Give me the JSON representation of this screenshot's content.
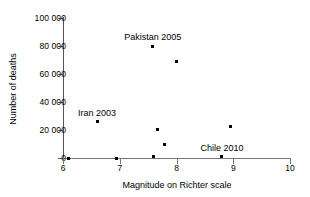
{
  "chart_data": {
    "type": "scatter",
    "title": "",
    "xlabel": "Magnitude on Richter scale",
    "ylabel": "Number of deaths",
    "xlim": [
      6,
      10
    ],
    "ylim": [
      0,
      100000
    ],
    "grid": false,
    "legend": null,
    "x_ticks": [
      "6",
      "7",
      "8",
      "9",
      "10"
    ],
    "x_tick_values": [
      6,
      7,
      8,
      9,
      10
    ],
    "y_ticks": [
      "0",
      "20 000",
      "40 000",
      "60 000",
      "80 000",
      "100 000"
    ],
    "y_tick_values": [
      0,
      20000,
      40000,
      60000,
      80000,
      100000
    ],
    "points": [
      {
        "x": 6.1,
        "y": 0
      },
      {
        "x": 6.6,
        "y": 26000
      },
      {
        "x": 6.95,
        "y": 0
      },
      {
        "x": 7.58,
        "y": 80000
      },
      {
        "x": 7.6,
        "y": 1000
      },
      {
        "x": 7.66,
        "y": 20500
      },
      {
        "x": 7.78,
        "y": 9500
      },
      {
        "x": 8.0,
        "y": 69000
      },
      {
        "x": 8.8,
        "y": 1000
      },
      {
        "x": 8.95,
        "y": 22500
      }
    ],
    "annotations": [
      {
        "text": "Pakistan 2005",
        "x": 7.58,
        "y": 80000
      },
      {
        "text": "Iran 2003",
        "x": 6.6,
        "y": 26000
      },
      {
        "text": "Chile 2010",
        "x": 8.8,
        "y": 1000
      }
    ]
  }
}
